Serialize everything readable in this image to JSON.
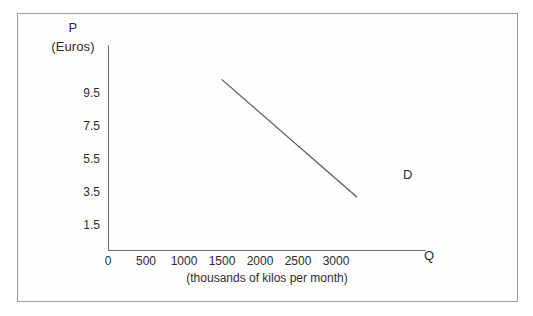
{
  "figure": {
    "background_color": "#ffffff",
    "frame_color": "#9a9a9a",
    "axis_color": "#6d6d6d"
  },
  "chart_data": {
    "type": "line",
    "title": "",
    "subtitle": "(thousands of kilos per month)",
    "xlabel": "Q",
    "ylabel": "P",
    "ylabel_unit": "(Euros)",
    "xlim": [
      0,
      3750
    ],
    "ylim": [
      0,
      11.5
    ],
    "grid": false,
    "legend": "inline-label-right",
    "xticks": [
      0,
      500,
      1000,
      1500,
      2000,
      2500,
      3000
    ],
    "xtick_labels": [
      "0",
      "500",
      "1000",
      "1500",
      "2000",
      "2500",
      "3000"
    ],
    "yticks": [
      1.5,
      3.5,
      5.5,
      7.5,
      9.5
    ],
    "ytick_labels": [
      "9.5",
      "7.5",
      "5.5",
      "3.5",
      "1.5"
    ],
    "series": [
      {
        "name": "D",
        "label": "D",
        "color": "#555555",
        "x": [
          1500,
          3270
        ],
        "y": [
          10.3,
          3.2
        ]
      }
    ]
  }
}
